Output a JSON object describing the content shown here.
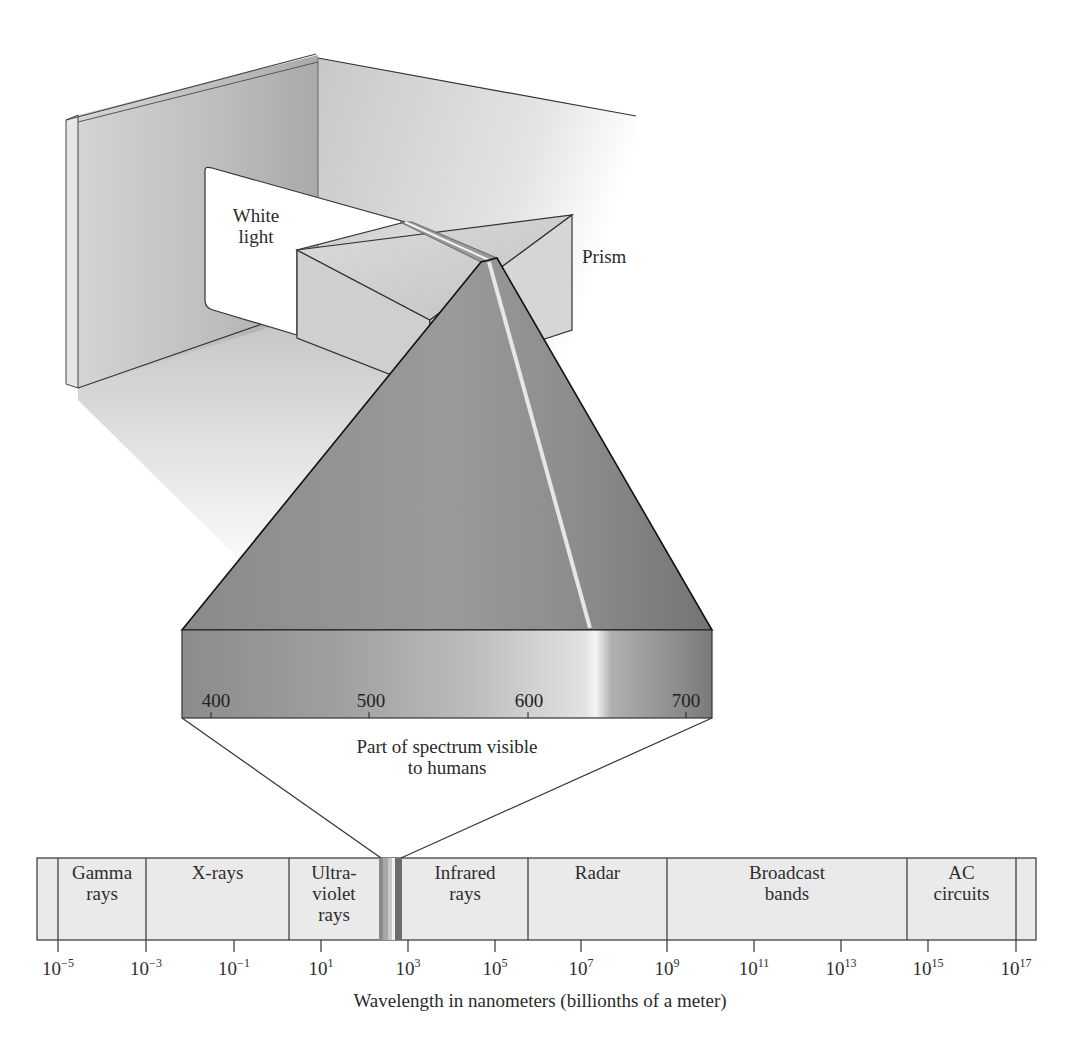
{
  "figure": {
    "labels": {
      "white_light": [
        "White",
        "light"
      ],
      "prism": "Prism",
      "visible_caption": [
        "Part of spectrum visible",
        "to humans"
      ],
      "axis_title": "Wavelength in nanometers (billionths of a meter)"
    },
    "visible_scale": {
      "ticks": [
        "400",
        "500",
        "600",
        "700"
      ]
    },
    "spectrum_bands": [
      {
        "label": [
          "Gamma",
          "rays"
        ]
      },
      {
        "label": [
          "X-rays"
        ]
      },
      {
        "label": [
          "Ultra-",
          "violet",
          "rays"
        ]
      },
      {
        "label": [
          "Infrared",
          "rays"
        ]
      },
      {
        "label": [
          "Radar"
        ]
      },
      {
        "label": [
          "Broadcast",
          "bands"
        ]
      },
      {
        "label": [
          "AC",
          "circuits"
        ]
      }
    ],
    "wavelength_ticks": [
      {
        "base": "10",
        "exp": "−5"
      },
      {
        "base": "10",
        "exp": "−3"
      },
      {
        "base": "10",
        "exp": "−1"
      },
      {
        "base": "10",
        "exp": "1"
      },
      {
        "base": "10",
        "exp": "3"
      },
      {
        "base": "10",
        "exp": "5"
      },
      {
        "base": "10",
        "exp": "7"
      },
      {
        "base": "10",
        "exp": "9"
      },
      {
        "base": "10",
        "exp": "11"
      },
      {
        "base": "10",
        "exp": "13"
      },
      {
        "base": "10",
        "exp": "15"
      },
      {
        "base": "10",
        "exp": "17"
      }
    ]
  }
}
